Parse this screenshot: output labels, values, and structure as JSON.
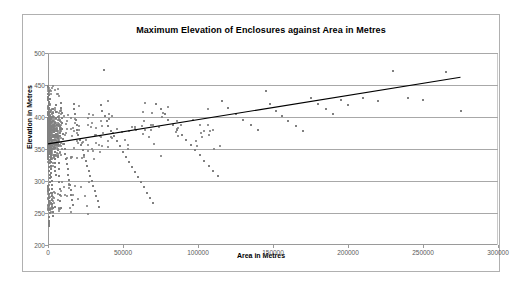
{
  "chart": {
    "title": "Maximum Elevation of Enclosures against Area in Metres",
    "xlabel": "Area in Metres",
    "ylabel": "Elevation in Metres",
    "y_ticks": [
      "200",
      "250",
      "300",
      "350",
      "400",
      "450",
      "500"
    ],
    "x_ticks": [
      "0",
      "50000",
      "100000",
      "150000",
      "200000",
      "250000",
      "300000"
    ]
  },
  "chart_data": {
    "type": "scatter",
    "title": "Maximum Elevation of Enclosures against Area in Metres",
    "subtitle": "",
    "xlabel": "Area in Metres",
    "ylabel": "Elevation in Metres",
    "xlim": [
      0,
      300000
    ],
    "ylim": [
      200,
      500
    ],
    "x_tick_values": [
      0,
      50000,
      100000,
      150000,
      200000,
      250000,
      300000
    ],
    "y_tick_values": [
      200,
      250,
      300,
      350,
      400,
      450,
      500
    ],
    "grid": "horizontal",
    "legend": "none",
    "marker_color": "#808080",
    "marker_size_px": 2,
    "trendline": {
      "type": "linear",
      "color": "#000000",
      "x_start": 0,
      "y_start": 358,
      "x_end": 275000,
      "y_end": 462
    },
    "annotations": [],
    "point_count_approx": 430,
    "points": [
      [
        300,
        430
      ],
      [
        400,
        424
      ],
      [
        500,
        418
      ],
      [
        600,
        440
      ],
      [
        700,
        412
      ],
      [
        800,
        406
      ],
      [
        900,
        434
      ],
      [
        1000,
        400
      ],
      [
        1100,
        428
      ],
      [
        1200,
        394
      ],
      [
        300,
        388
      ],
      [
        500,
        382
      ],
      [
        700,
        376
      ],
      [
        900,
        370
      ],
      [
        1100,
        364
      ],
      [
        1300,
        358
      ],
      [
        1500,
        352
      ],
      [
        1700,
        346
      ],
      [
        1900,
        340
      ],
      [
        2100,
        334
      ],
      [
        400,
        328
      ],
      [
        600,
        322
      ],
      [
        800,
        316
      ],
      [
        1000,
        310
      ],
      [
        1200,
        304
      ],
      [
        1400,
        298
      ],
      [
        300,
        292
      ],
      [
        500,
        286
      ],
      [
        700,
        280
      ],
      [
        900,
        274
      ],
      [
        600,
        268
      ],
      [
        800,
        262
      ],
      [
        1000,
        256
      ],
      [
        1200,
        250
      ],
      [
        400,
        244
      ],
      [
        500,
        238
      ],
      [
        700,
        234
      ],
      [
        900,
        232
      ],
      [
        600,
        230
      ],
      [
        800,
        236
      ],
      [
        200,
        432
      ],
      [
        250,
        426
      ],
      [
        350,
        420
      ],
      [
        450,
        414
      ],
      [
        550,
        408
      ],
      [
        650,
        402
      ],
      [
        750,
        396
      ],
      [
        850,
        390
      ],
      [
        950,
        384
      ],
      [
        1050,
        378
      ],
      [
        1150,
        372
      ],
      [
        1250,
        366
      ],
      [
        1350,
        360
      ],
      [
        1450,
        354
      ],
      [
        1550,
        348
      ],
      [
        1650,
        342
      ],
      [
        1750,
        336
      ],
      [
        1850,
        330
      ],
      [
        1950,
        324
      ],
      [
        2050,
        318
      ],
      [
        2150,
        312
      ],
      [
        2250,
        306
      ],
      [
        2350,
        300
      ],
      [
        2450,
        294
      ],
      [
        2550,
        288
      ],
      [
        2650,
        282
      ],
      [
        2750,
        276
      ],
      [
        2850,
        270
      ],
      [
        2950,
        264
      ],
      [
        3050,
        258
      ],
      [
        3150,
        252
      ],
      [
        3250,
        246
      ],
      [
        3350,
        412
      ],
      [
        3450,
        406
      ],
      [
        3550,
        400
      ],
      [
        3650,
        394
      ],
      [
        3750,
        388
      ],
      [
        3850,
        382
      ],
      [
        3950,
        376
      ],
      [
        4050,
        370
      ],
      [
        4150,
        364
      ],
      [
        4250,
        358
      ],
      [
        4350,
        352
      ],
      [
        4450,
        346
      ],
      [
        4550,
        340
      ],
      [
        4650,
        334
      ],
      [
        4750,
        328
      ],
      [
        4850,
        322
      ],
      [
        4950,
        316
      ],
      [
        5050,
        310
      ],
      [
        5200,
        418
      ],
      [
        5400,
        408
      ],
      [
        5600,
        398
      ],
      [
        5800,
        388
      ],
      [
        6000,
        378
      ],
      [
        6200,
        368
      ],
      [
        6400,
        358
      ],
      [
        6600,
        348
      ],
      [
        6800,
        338
      ],
      [
        7000,
        328
      ],
      [
        7200,
        318
      ],
      [
        7400,
        308
      ],
      [
        7600,
        298
      ],
      [
        7800,
        288
      ],
      [
        8000,
        278
      ],
      [
        8200,
        268
      ],
      [
        8400,
        258
      ],
      [
        8600,
        422
      ],
      [
        8800,
        414
      ],
      [
        9000,
        406
      ],
      [
        9200,
        398
      ],
      [
        9400,
        390
      ],
      [
        9600,
        382
      ],
      [
        9800,
        374
      ],
      [
        10000,
        366
      ],
      [
        10500,
        358
      ],
      [
        11000,
        350
      ],
      [
        11500,
        342
      ],
      [
        12000,
        334
      ],
      [
        12500,
        326
      ],
      [
        13000,
        318
      ],
      [
        13500,
        310
      ],
      [
        14000,
        302
      ],
      [
        14500,
        294
      ],
      [
        15000,
        286
      ],
      [
        15500,
        278
      ],
      [
        16000,
        270
      ],
      [
        16500,
        262
      ],
      [
        17000,
        420
      ],
      [
        17500,
        412
      ],
      [
        18000,
        404
      ],
      [
        18500,
        396
      ],
      [
        19000,
        388
      ],
      [
        19500,
        380
      ],
      [
        20000,
        372
      ],
      [
        21000,
        364
      ],
      [
        22000,
        356
      ],
      [
        23000,
        348
      ],
      [
        24000,
        340
      ],
      [
        25000,
        332
      ],
      [
        26000,
        324
      ],
      [
        27000,
        316
      ],
      [
        28000,
        308
      ],
      [
        29000,
        300
      ],
      [
        30000,
        292
      ],
      [
        31000,
        284
      ],
      [
        32000,
        276
      ],
      [
        33000,
        268
      ],
      [
        34000,
        260
      ],
      [
        35000,
        418
      ],
      [
        36000,
        410
      ],
      [
        37000,
        473
      ],
      [
        38000,
        402
      ],
      [
        39000,
        394
      ],
      [
        40000,
        386
      ],
      [
        42000,
        378
      ],
      [
        44000,
        370
      ],
      [
        46000,
        362
      ],
      [
        48000,
        354
      ],
      [
        50000,
        346
      ],
      [
        52000,
        338
      ],
      [
        54000,
        330
      ],
      [
        56000,
        322
      ],
      [
        58000,
        314
      ],
      [
        60000,
        306
      ],
      [
        62000,
        298
      ],
      [
        64000,
        290
      ],
      [
        66000,
        282
      ],
      [
        68000,
        274
      ],
      [
        70000,
        266
      ],
      [
        72000,
        420
      ],
      [
        75000,
        412
      ],
      [
        78000,
        404
      ],
      [
        80000,
        396
      ],
      [
        83000,
        388
      ],
      [
        86000,
        380
      ],
      [
        89000,
        372
      ],
      [
        92000,
        364
      ],
      [
        95000,
        356
      ],
      [
        98000,
        348
      ],
      [
        101000,
        340
      ],
      [
        104000,
        332
      ],
      [
        107000,
        324
      ],
      [
        110000,
        316
      ],
      [
        113000,
        308
      ],
      [
        116000,
        425
      ],
      [
        120000,
        414
      ],
      [
        125000,
        405
      ],
      [
        130000,
        396
      ],
      [
        135000,
        388
      ],
      [
        140000,
        380
      ],
      [
        145000,
        440
      ],
      [
        148000,
        420
      ],
      [
        152000,
        410
      ],
      [
        156000,
        402
      ],
      [
        160000,
        394
      ],
      [
        165000,
        386
      ],
      [
        170000,
        378
      ],
      [
        175000,
        430
      ],
      [
        180000,
        420
      ],
      [
        185000,
        412
      ],
      [
        190000,
        404
      ],
      [
        195000,
        426
      ],
      [
        200000,
        418
      ],
      [
        210000,
        430
      ],
      [
        220000,
        425
      ],
      [
        230000,
        472
      ],
      [
        240000,
        430
      ],
      [
        250000,
        426
      ],
      [
        265000,
        470
      ],
      [
        275000,
        410
      ]
    ]
  }
}
